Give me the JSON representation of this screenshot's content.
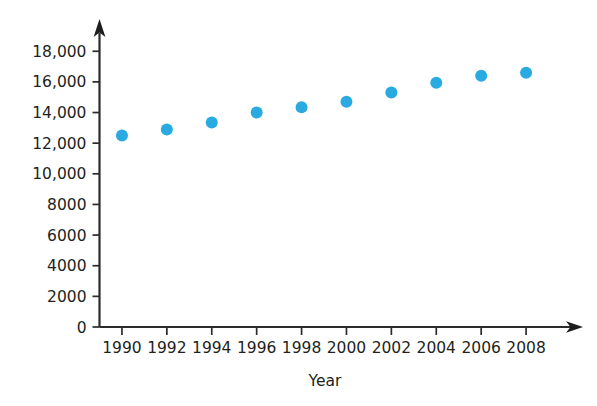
{
  "chart_data": {
    "type": "scatter",
    "title": "",
    "subtitle": "",
    "xlabel": "Year",
    "ylabel": "",
    "x": [
      1990,
      1992,
      1994,
      1996,
      1998,
      2000,
      2002,
      2004,
      2006,
      2008
    ],
    "values": [
      12500,
      12900,
      13350,
      14000,
      14350,
      14700,
      15300,
      15950,
      16400,
      16600
    ],
    "series": [
      {
        "name": "",
        "color": "#29abe2",
        "points": [
          {
            "x": 1990,
            "y": 12500
          },
          {
            "x": 1992,
            "y": 12900
          },
          {
            "x": 1994,
            "y": 13350
          },
          {
            "x": 1996,
            "y": 14000
          },
          {
            "x": 1998,
            "y": 14350
          },
          {
            "x": 2000,
            "y": 14700
          },
          {
            "x": 2002,
            "y": 15300
          },
          {
            "x": 2004,
            "y": 15950
          },
          {
            "x": 2006,
            "y": 16400
          },
          {
            "x": 2008,
            "y": 16600
          }
        ]
      }
    ],
    "xlim": [
      1989,
      2009.6
    ],
    "ylim": [
      0,
      18800
    ],
    "x_tick_values": [
      1990,
      1992,
      1994,
      1996,
      1998,
      2000,
      2002,
      2004,
      2006,
      2008
    ],
    "x_tick_labels": [
      "1990",
      "1992",
      "1994",
      "1996",
      "1998",
      "2000",
      "2002",
      "2004",
      "2006",
      "2008"
    ],
    "y_tick_values": [
      0,
      2000,
      4000,
      6000,
      8000,
      10000,
      12000,
      14000,
      16000,
      18000
    ],
    "y_tick_labels": [
      "0",
      "2000",
      "4000",
      "6000",
      "8000",
      "10,000",
      "12,000",
      "14,000",
      "16,000",
      "18,000"
    ],
    "grid": false,
    "legend": false,
    "legend_position": "none",
    "annotations": [],
    "marker": "circle",
    "marker_radius": 6,
    "axis_style": "arrow-tipped",
    "background_color": "#ffffff",
    "axis_color": "#2b2b2b",
    "text_color": "#231f20"
  },
  "axis_titles": {
    "x": "Year",
    "y": ""
  }
}
